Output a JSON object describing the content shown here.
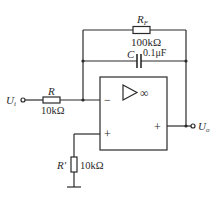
{
  "diagram": {
    "type": "op-amp circuit (inverting integrator with feedback resistor)",
    "input_terminal": {
      "label": "U",
      "subscript": "i"
    },
    "output_terminal": {
      "label": "U",
      "subscript": "o"
    },
    "input_resistor": {
      "name": "R",
      "value": "10kΩ"
    },
    "feedback_resistor": {
      "name": "R",
      "subscript": "F",
      "value": "100kΩ"
    },
    "feedback_capacitor": {
      "name": "C",
      "value": "0.1μF"
    },
    "balance_resistor": {
      "name": "R′",
      "value": "10kΩ"
    },
    "opamp": {
      "symbol": "▷",
      "gain": "∞",
      "inverting_input": "−",
      "noninverting_input": "+",
      "output_sign": "+"
    },
    "colors": {
      "line": "#2a2a2a",
      "background": "#ffffff"
    }
  }
}
